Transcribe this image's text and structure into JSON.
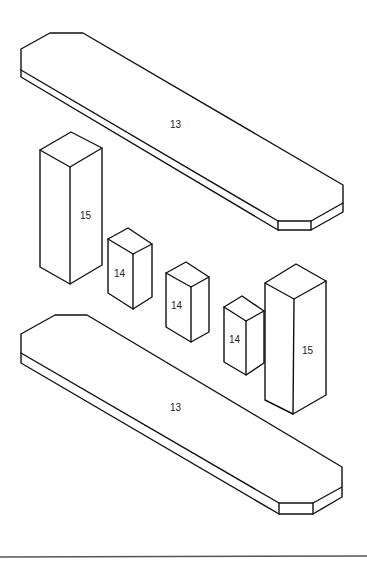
{
  "diagram": {
    "type": "isometric exploded assembly",
    "parts": [
      {
        "id": "top-board",
        "label": "13"
      },
      {
        "id": "block-tall-left",
        "label": "15"
      },
      {
        "id": "block-small-1",
        "label": "14"
      },
      {
        "id": "block-small-2",
        "label": "14"
      },
      {
        "id": "block-small-3",
        "label": "14"
      },
      {
        "id": "block-tall-right",
        "label": "15"
      },
      {
        "id": "bottom-board",
        "label": "13"
      }
    ]
  },
  "labels": {
    "top_board": "13",
    "block_tall_left": "15",
    "block_small_1": "14",
    "block_small_2": "14",
    "block_small_3": "14",
    "block_tall_right": "15",
    "bottom_board": "13"
  }
}
